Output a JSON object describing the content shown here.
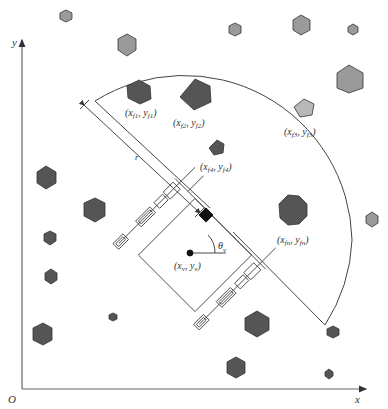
{
  "diagram": {
    "axes": {
      "origin": "O",
      "x": "x",
      "y": "y"
    },
    "sensor_range_label": "r",
    "robot_pose": {
      "position_label": "(x_v, y_v)",
      "x": "x",
      "x_sub": "v",
      "y": "y",
      "y_sub": "v",
      "angle_label": "θ",
      "angle_sub": "v"
    },
    "features": [
      {
        "id": "f1",
        "x": "x",
        "x_sub": "f1",
        "y": "y",
        "y_sub": "f1"
      },
      {
        "id": "f2",
        "x": "x",
        "x_sub": "f2",
        "y": "y",
        "y_sub": "f2"
      },
      {
        "id": "f3",
        "x": "x",
        "x_sub": "f3",
        "y": "y",
        "y_sub": "f3"
      },
      {
        "id": "f4",
        "x": "x",
        "x_sub": "f4",
        "y": "y",
        "y_sub": "f4"
      },
      {
        "id": "fn",
        "x": "x",
        "x_sub": "fn",
        "y": "y",
        "y_sub": "fn"
      }
    ],
    "colors": {
      "dark_obstacle": "#555555",
      "light_obstacle": "#9a9a9a",
      "lightest_obstacle": "#b8b8b8",
      "line": "#444444"
    }
  }
}
